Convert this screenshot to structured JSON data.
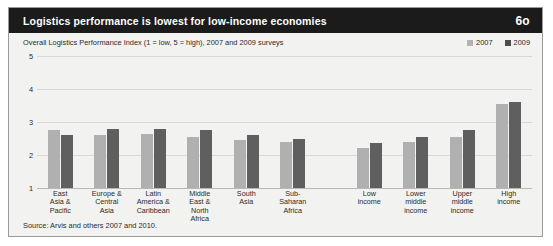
{
  "header": {
    "title": "Logistics performance is lowest for low-income economies",
    "number": "6o"
  },
  "subtitle": "Overall Logistics Performance Index (1 = low, 5 = high), 2007 and 2009 surveys",
  "source": "Source: Arvis and others 2007 and 2010.",
  "legend": [
    {
      "label": "2007",
      "color": "#b0b0b0"
    },
    {
      "label": "2009",
      "color": "#5f5f5f"
    }
  ],
  "chart_data": {
    "type": "bar",
    "title": "Logistics performance is lowest for low-income economies",
    "subtitle": "Overall Logistics Performance Index (1 = low, 5 = high), 2007 and 2009 surveys",
    "xlabel": "",
    "ylabel": "",
    "ylim": [
      1,
      5
    ],
    "yticks": [
      "1",
      "2",
      "3",
      "4",
      "5"
    ],
    "grid": true,
    "legend_position": "top-right",
    "categories": [
      "East\nAsia &\nPacific",
      "Europe &\nCentral\nAsia",
      "Latin\nAmerica &\nCaribbean",
      "Middle\nEast &\nNorth\nAfrica",
      "South\nAsia",
      "Sub-\nSaharan\nAfrica",
      "Low\nincome",
      "Lower\nmiddle\nincome",
      "Upper\nmiddle\nincome",
      "High\nincome"
    ],
    "group_break_after_index": 5,
    "series": [
      {
        "name": "2007",
        "color": "#b0b0b0",
        "values": [
          2.75,
          2.6,
          2.65,
          2.55,
          2.45,
          2.4,
          2.2,
          2.4,
          2.55,
          3.55
        ]
      },
      {
        "name": "2009",
        "color": "#5f5f5f",
        "values": [
          2.6,
          2.8,
          2.8,
          2.75,
          2.6,
          2.5,
          2.35,
          2.55,
          2.75,
          3.6
        ]
      }
    ]
  }
}
